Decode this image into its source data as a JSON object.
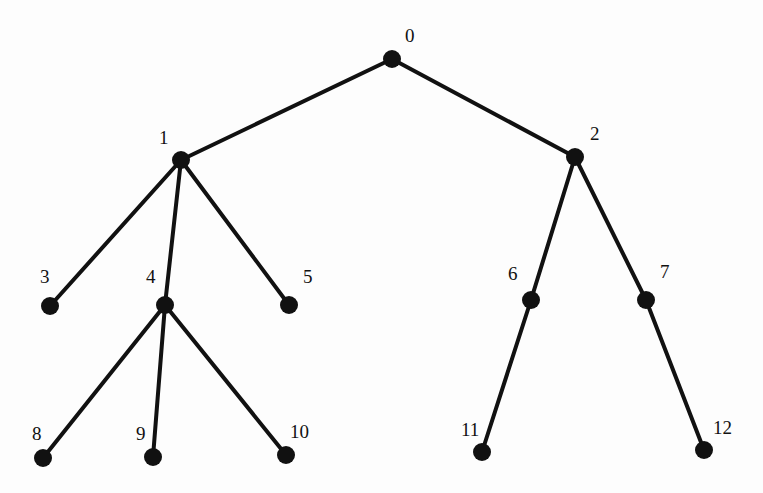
{
  "diagram": {
    "type": "tree",
    "nodes": [
      {
        "id": "0",
        "label": "0",
        "x": 392,
        "y": 59,
        "lx": 405,
        "ly": 26
      },
      {
        "id": "1",
        "label": "1",
        "x": 181,
        "y": 160,
        "lx": 159,
        "ly": 128
      },
      {
        "id": "2",
        "label": "2",
        "x": 575,
        "y": 157,
        "lx": 590,
        "ly": 124
      },
      {
        "id": "3",
        "label": "3",
        "x": 50,
        "y": 306,
        "lx": 40,
        "ly": 267
      },
      {
        "id": "4",
        "label": "4",
        "x": 165,
        "y": 305,
        "lx": 146,
        "ly": 267
      },
      {
        "id": "5",
        "label": "5",
        "x": 289,
        "y": 305,
        "lx": 303,
        "ly": 267
      },
      {
        "id": "6",
        "label": "6",
        "x": 531,
        "y": 300,
        "lx": 508,
        "ly": 264
      },
      {
        "id": "7",
        "label": "7",
        "x": 646,
        "y": 300,
        "lx": 660,
        "ly": 262
      },
      {
        "id": "8",
        "label": "8",
        "x": 43,
        "y": 458,
        "lx": 32,
        "ly": 424
      },
      {
        "id": "9",
        "label": "9",
        "x": 153,
        "y": 457,
        "lx": 136,
        "ly": 424
      },
      {
        "id": "10",
        "label": "10",
        "x": 286,
        "y": 455,
        "lx": 290,
        "ly": 422
      },
      {
        "id": "11",
        "label": "11",
        "x": 482,
        "y": 452,
        "lx": 461,
        "ly": 420
      },
      {
        "id": "12",
        "label": "12",
        "x": 704,
        "y": 450,
        "lx": 713,
        "ly": 418
      }
    ],
    "edges": [
      [
        "0",
        "1"
      ],
      [
        "0",
        "2"
      ],
      [
        "1",
        "3"
      ],
      [
        "1",
        "4"
      ],
      [
        "1",
        "5"
      ],
      [
        "4",
        "8"
      ],
      [
        "4",
        "9"
      ],
      [
        "4",
        "10"
      ],
      [
        "2",
        "6"
      ],
      [
        "2",
        "7"
      ],
      [
        "6",
        "11"
      ],
      [
        "7",
        "12"
      ]
    ],
    "colors": {
      "edge": "#111111",
      "node": "#111111",
      "background": "#fdfdfd"
    }
  }
}
